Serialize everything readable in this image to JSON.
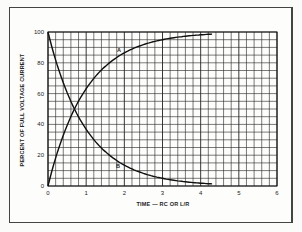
{
  "chart_data": {
    "type": "line",
    "title": "",
    "xlabel": "TIME — RC OR L/R",
    "ylabel": "PERCENT OF FULL VOLTAGE CURRENT",
    "xlim": [
      0,
      6
    ],
    "ylim": [
      0,
      100
    ],
    "x_ticks": [
      "0",
      "1",
      "2",
      "3",
      "4",
      "5",
      "6"
    ],
    "y_ticks": [
      "0",
      "20",
      "40",
      "60",
      "80",
      "100"
    ],
    "grid": true,
    "grid_minor_x_step": 0.2,
    "grid_minor_y_step": 5,
    "x": [
      0,
      0.5,
      1,
      1.5,
      2,
      2.5,
      3,
      3.5,
      4
    ],
    "series": [
      {
        "name": "A",
        "label": "A",
        "values": [
          0,
          39,
          63,
          78,
          86,
          92,
          95,
          97,
          98
        ]
      },
      {
        "name": "B",
        "label": "B",
        "values": [
          100,
          61,
          37,
          22,
          14,
          8,
          5,
          3,
          2
        ]
      }
    ],
    "legend": "none (curves labeled inline A and B)"
  },
  "labels": {
    "curve_a": "A",
    "curve_b": "B",
    "xlabel": "TIME — RC OR L/R",
    "ylabel": "PERCENT OF FULL VOLTAGE CURRENT"
  }
}
